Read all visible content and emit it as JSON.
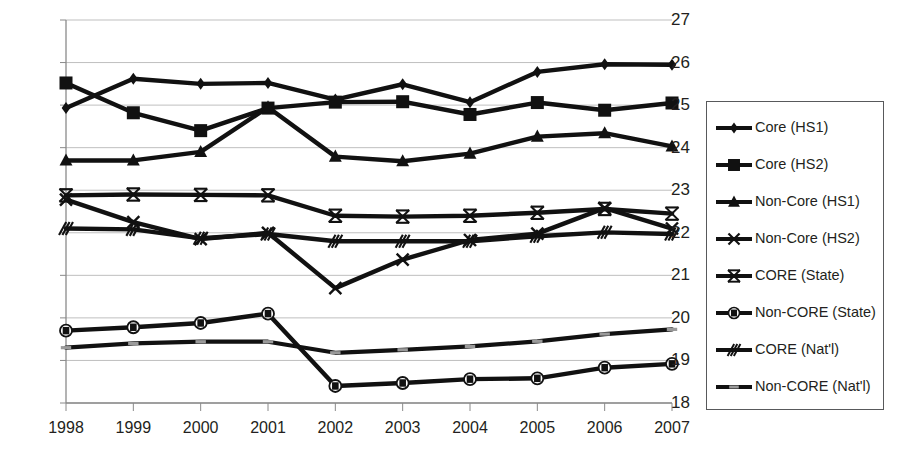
{
  "chart_data": {
    "type": "line",
    "title": "",
    "xlabel": "",
    "ylabel": "",
    "grid": true,
    "legend_position": "right",
    "categories": [
      "1998",
      "1999",
      "2000",
      "2001",
      "2002",
      "2003",
      "2004",
      "2005",
      "2006",
      "2007"
    ],
    "x": [
      1998,
      1999,
      2000,
      2001,
      2002,
      2003,
      2004,
      2005,
      2006,
      2007
    ],
    "ylim": [
      18,
      27
    ],
    "xlim": [
      1998,
      2007
    ],
    "yticks": [
      "18",
      "19",
      "20",
      "21",
      "22",
      "23",
      "24",
      "25",
      "26",
      "27"
    ],
    "series": [
      {
        "name": "Core (HS1)",
        "marker": "diamond",
        "values": [
          24.93,
          25.62,
          25.5,
          25.52,
          25.13,
          25.49,
          25.07,
          25.78,
          25.96,
          25.95
        ]
      },
      {
        "name": "Core (HS2)",
        "marker": "square",
        "values": [
          25.52,
          24.82,
          24.4,
          24.93,
          25.07,
          25.08,
          24.78,
          25.06,
          24.88,
          25.05
        ]
      },
      {
        "name": "Non-Core (HS1)",
        "marker": "triangle",
        "values": [
          23.7,
          23.7,
          23.9,
          24.95,
          23.79,
          23.68,
          23.86,
          24.26,
          24.34,
          24.03
        ]
      },
      {
        "name": "Non-Core (HS2)",
        "marker": "x",
        "values": [
          22.78,
          22.25,
          21.85,
          22.0,
          20.7,
          21.37,
          21.83,
          21.98,
          22.58,
          22.1
        ]
      },
      {
        "name": "CORE (State)",
        "marker": "asterisk",
        "values": [
          22.88,
          22.9,
          22.89,
          22.88,
          22.4,
          22.38,
          22.4,
          22.47,
          22.56,
          22.45
        ]
      },
      {
        "name": "Non-CORE (State)",
        "marker": "circle-bar",
        "values": [
          19.7,
          19.78,
          19.88,
          20.1,
          18.4,
          18.47,
          18.56,
          18.58,
          18.83,
          18.92
        ]
      },
      {
        "name": "CORE (Nat'l)",
        "marker": "slash",
        "values": [
          22.1,
          22.08,
          21.87,
          21.97,
          21.8,
          21.8,
          21.8,
          21.92,
          22.01,
          21.97
        ]
      },
      {
        "name": "Non-CORE (Nat'l)",
        "marker": "dashline",
        "values": [
          19.3,
          19.4,
          19.44,
          19.44,
          19.18,
          19.25,
          19.33,
          19.45,
          19.62,
          19.73
        ]
      }
    ]
  },
  "legend": {
    "items": [
      {
        "label": "Core (HS1)"
      },
      {
        "label": "Core (HS2)"
      },
      {
        "label": "Non-Core (HS1)"
      },
      {
        "label": "Non-Core (HS2)"
      },
      {
        "label": "CORE (State)"
      },
      {
        "label": "Non-CORE (State)"
      },
      {
        "label": "CORE (Nat'l)"
      },
      {
        "label": "Non-CORE (Nat'l)"
      }
    ]
  },
  "colors": {
    "series": "#111111",
    "grid": "#bfbfbf",
    "axis": "#8a8a8a",
    "text": "#231f20",
    "legend_border": "#58595b"
  }
}
